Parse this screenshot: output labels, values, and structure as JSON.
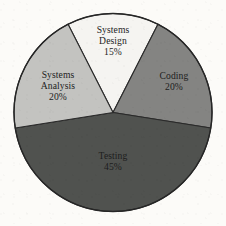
{
  "chart_data": {
    "type": "pie",
    "title": "",
    "xlabel": "",
    "ylabel": "",
    "unit": "%",
    "total": 100,
    "legend": "none",
    "grid": false,
    "labels_inside_slices": true,
    "start_angle_deg": -27,
    "direction": "clockwise",
    "categories": [
      "Systems Design",
      "Coding",
      "Testing",
      "Systems Analysis"
    ],
    "values": [
      15,
      20,
      45,
      20
    ],
    "slices": [
      {
        "name": "Systems Design",
        "name_line1": "Systems",
        "name_line2": "Design",
        "value": 15,
        "value_label": "15%",
        "color": "#f5f4f1",
        "start_deg": -27,
        "end_deg": 27
      },
      {
        "name": "Coding",
        "name_line1": "Coding",
        "name_line2": "",
        "value": 20,
        "value_label": "20%",
        "color": "#848482",
        "start_deg": 27,
        "end_deg": 99
      },
      {
        "name": "Testing",
        "name_line1": "Testing",
        "name_line2": "",
        "value": 45,
        "value_label": "45%",
        "color": "#50524f",
        "start_deg": 99,
        "end_deg": 261
      },
      {
        "name": "Systems Analysis",
        "name_line1": "Systems",
        "name_line2": "Analysis",
        "value": 20,
        "value_label": "20%",
        "color": "#c3c3c0",
        "start_deg": 261,
        "end_deg": 333
      }
    ],
    "geometry": {
      "center_x": 113,
      "center_y": 112.5,
      "radius": 99
    },
    "colors": {
      "background": "#fcfbf8",
      "outline": "#262626",
      "text": "#1d1d1d"
    }
  }
}
